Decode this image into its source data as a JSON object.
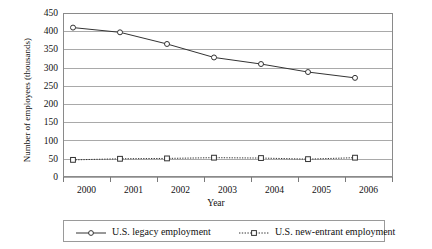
{
  "chart_data": {
    "type": "line",
    "title": "",
    "xlabel": "Year",
    "ylabel": "Number of employees (thousands)",
    "categories": [
      "2000",
      "2001",
      "2002",
      "2003",
      "2004",
      "2005",
      "2006"
    ],
    "x": [
      2000,
      2001,
      2002,
      2003,
      2004,
      2005,
      2006
    ],
    "ylim": [
      0,
      450
    ],
    "yticks": [
      0,
      50,
      100,
      150,
      200,
      250,
      300,
      350,
      400,
      450
    ],
    "ytick_labels": [
      "0",
      "50",
      "100",
      "150",
      "200",
      "250",
      "300",
      "350",
      "400",
      "450"
    ],
    "grid": true,
    "legend_position": "bottom",
    "series": [
      {
        "name": "U.S. legacy employment",
        "values": [
          410,
          397,
          365,
          328,
          310,
          288,
          272
        ],
        "marker": "open-circle",
        "line_style": "solid",
        "color": "#333333"
      },
      {
        "name": "U.S. new-entrant employment",
        "values": [
          47,
          50,
          51,
          53,
          52,
          49,
          53
        ],
        "marker": "open-square",
        "line_style": "dotted",
        "color": "#333333"
      }
    ]
  },
  "legend": {
    "entries": [
      {
        "label": "U.S. legacy employment",
        "key": "solid-line-circle-marker-icon"
      },
      {
        "label": "U.S. new-entrant employment",
        "key": "dotted-line-square-marker-icon"
      }
    ]
  }
}
